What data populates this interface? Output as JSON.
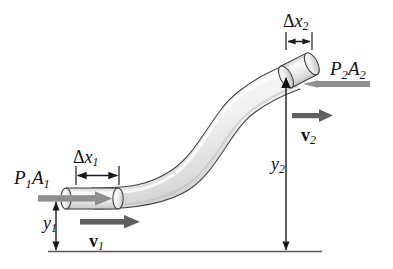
{
  "figure": {
    "background_color": "#ffffff",
    "width": 393,
    "height": 269
  },
  "colors": {
    "pipe_outline": "#3a3a3a",
    "pipe_fill_light": "#fdfdfd",
    "pipe_fill_mid": "#e4e4e4",
    "pipe_fill_shadow": "#c9c9c9",
    "pressure_arrow": "#8f8f8f",
    "velocity_arrow": "#5f5f5f",
    "dimension_line": "#1a1a1a",
    "baseline": "#555555",
    "text": "#111111"
  },
  "labels": {
    "pressure_force_inlet": {
      "symbol": "P",
      "sub1": "1",
      "symbol2": "A",
      "sub2": "1",
      "text": "P1A1"
    },
    "pressure_force_outlet": {
      "symbol": "P",
      "sub1": "2",
      "symbol2": "A",
      "sub2": "2",
      "text": "P2A2"
    },
    "displacement_inlet": {
      "delta": "Δ",
      "var": "x",
      "sub": "1",
      "text": "Δx1"
    },
    "displacement_outlet": {
      "delta": "Δ",
      "var": "x",
      "sub": "2",
      "text": "Δx2"
    },
    "height_inlet": {
      "var": "y",
      "sub": "1",
      "text": "y1"
    },
    "height_outlet": {
      "var": "y",
      "sub": "2",
      "text": "y2"
    },
    "velocity_inlet": {
      "var": "v",
      "sub": "1",
      "text": "v1"
    },
    "velocity_outlet": {
      "var": "v",
      "sub": "2",
      "text": "v2"
    }
  },
  "elements": {
    "pipe": "s-curved-tube-rising-left-to-right",
    "fluid_element_inlet": "shaded-cylinder-at-pipe-inlet",
    "fluid_element_outlet": "shaded-cylinder-at-pipe-outlet",
    "baseline": "horizontal-reference-datum-line",
    "inlet_pressure_arrow_direction": "right",
    "outlet_pressure_arrow_direction": "left",
    "inlet_velocity_arrow_direction": "right",
    "outlet_velocity_arrow_direction": "right",
    "height_arrow_inlet_direction": "vertical-double-headed",
    "height_arrow_outlet_direction": "down"
  }
}
